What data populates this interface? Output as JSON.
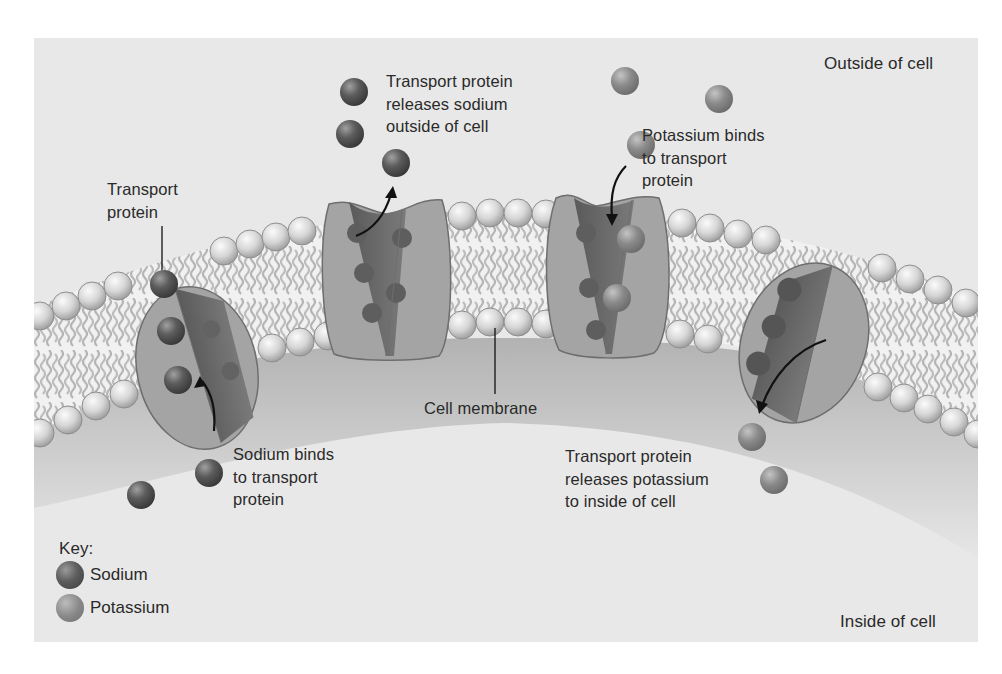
{
  "figure": {
    "regions": {
      "outside": "Outside of cell",
      "inside": "Inside of cell"
    },
    "labels": {
      "transport_protein": "Transport\nprotein",
      "releases_sodium": "Transport protein\nreleases sodium\noutside of cell",
      "potassium_binds": "Potassium binds\nto transport\nprotein",
      "cell_membrane": "Cell membrane",
      "sodium_binds": "Sodium binds\nto transport\nprotein",
      "releases_potassium": "Transport protein\nreleases potassium\nto inside of cell"
    },
    "key": {
      "title": "Key:",
      "items": [
        {
          "label": "Sodium",
          "color": "#4a4a4a"
        },
        {
          "label": "Potassium",
          "color": "#878787"
        }
      ]
    },
    "colors": {
      "background": "#e8e8e8",
      "protein_light": "#a4a4a4",
      "protein_dark": "#6a6a6a",
      "lipid_head": "#d8d8d8",
      "sodium": "#4a4a4a",
      "potassium": "#878787",
      "text": "#2a2a2a"
    }
  }
}
